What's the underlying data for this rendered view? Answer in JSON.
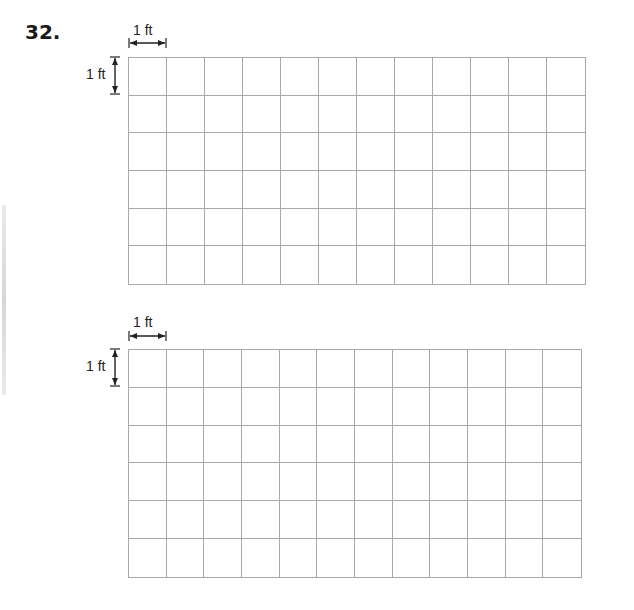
{
  "problem": {
    "number": "32."
  },
  "grids": [
    {
      "id": "grid-1",
      "cols": 12,
      "rows": 6,
      "left": 128,
      "top": 57,
      "width": 458,
      "height": 228,
      "scale_h_label": "1 ft",
      "scale_v_label": "1 ft"
    },
    {
      "id": "grid-2",
      "cols": 12,
      "rows": 6,
      "left": 128,
      "top": 349,
      "width": 454,
      "height": 229,
      "scale_h_label": "1 ft",
      "scale_v_label": "1 ft"
    }
  ],
  "colors": {
    "grid_line": "#a8a8a8",
    "text": "#222222"
  }
}
